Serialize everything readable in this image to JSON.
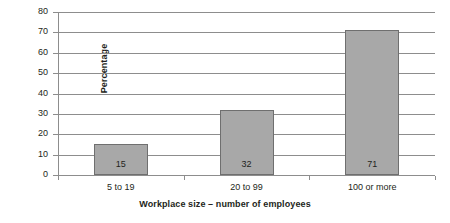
{
  "chart_data": {
    "type": "bar",
    "title": "",
    "categories": [
      "5 to 19",
      "20 to 99",
      "100 or more"
    ],
    "values": [
      15,
      32,
      71
    ],
    "value_labels": [
      "15",
      "32",
      "71"
    ],
    "xlabel": "Workplace size – number of employees",
    "ylabel": "Percentage",
    "ylim": [
      0,
      80
    ],
    "yticks": [
      0,
      10,
      20,
      30,
      40,
      50,
      60,
      70,
      80
    ],
    "ytick_labels": [
      "0",
      "10",
      "20",
      "30",
      "40",
      "50",
      "60",
      "70",
      "80"
    ],
    "grid": true,
    "legend": false,
    "bar_color": "#a8a8a8",
    "bar_border_color": "#6f6f6f",
    "axis_color": "#8d8d8d",
    "text_color": "#231f20"
  }
}
